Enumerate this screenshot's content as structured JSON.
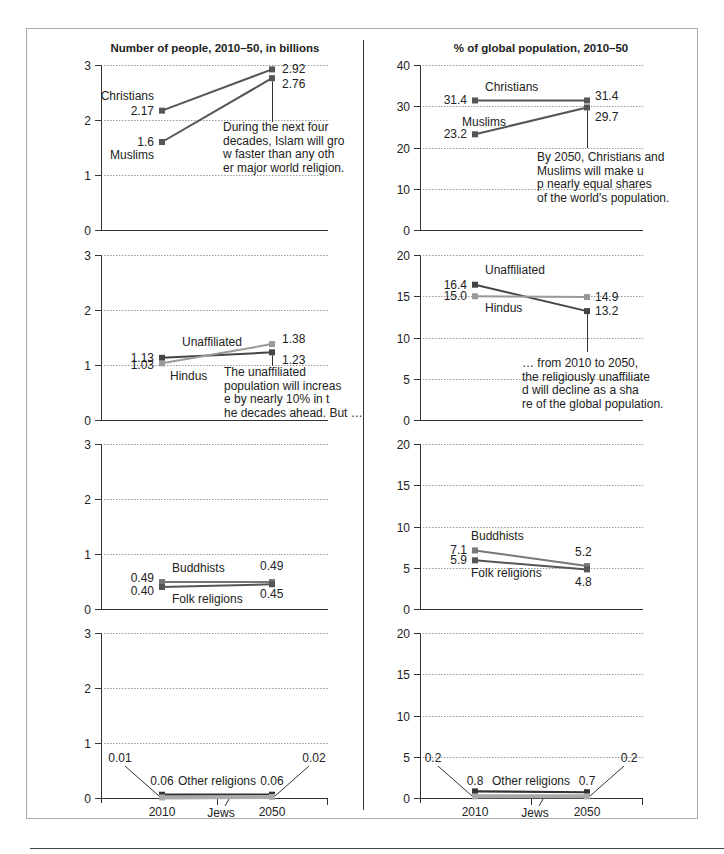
{
  "chart_data": [
    {
      "type": "line",
      "panel": "number-row-1",
      "title": "Number of people, 2010–50, in billions",
      "x": [
        "2010",
        "2050"
      ],
      "ylim": [
        0,
        3
      ],
      "yticks": [
        0,
        1,
        2,
        3
      ],
      "grid": true,
      "series": [
        {
          "name": "Christians",
          "values": [
            2.17,
            2.92
          ],
          "labels": [
            "2.17",
            "2.92"
          ],
          "color": "#555555"
        },
        {
          "name": "Muslims",
          "values": [
            1.6,
            2.76
          ],
          "labels": [
            "1.6",
            "2.76"
          ],
          "color": "#555555"
        }
      ],
      "annotation": "During the next four decades, Islam will grow faster than any other major world religion."
    },
    {
      "type": "line",
      "panel": "share-row-1",
      "title": "% of global population, 2010–50",
      "x": [
        "2010",
        "2050"
      ],
      "ylim": [
        0,
        40
      ],
      "yticks": [
        0,
        10,
        20,
        30,
        40
      ],
      "grid": true,
      "series": [
        {
          "name": "Christians",
          "values": [
            31.4,
            31.4
          ],
          "labels": [
            "31.4",
            "31.4"
          ],
          "color": "#555555"
        },
        {
          "name": "Muslims",
          "values": [
            23.2,
            29.7
          ],
          "labels": [
            "23.2",
            "29.7"
          ],
          "color": "#555555"
        }
      ],
      "annotation": "By 2050, Christians and Muslims will make up nearly equal shares of the world's population."
    },
    {
      "type": "line",
      "panel": "number-row-2",
      "x": [
        "2010",
        "2050"
      ],
      "ylim": [
        0,
        3
      ],
      "yticks": [
        0,
        1,
        2,
        3
      ],
      "grid": true,
      "series": [
        {
          "name": "Unaffiliated",
          "values": [
            1.13,
            1.23
          ],
          "labels": [
            "1.13",
            "1.23"
          ],
          "color": "#444444"
        },
        {
          "name": "Hindus",
          "values": [
            1.03,
            1.38
          ],
          "labels": [
            "1.03",
            "1.38"
          ],
          "color": "#999999"
        }
      ],
      "annotation": "The unaffiliated population will increase by nearly 10% in the decades ahead. But …"
    },
    {
      "type": "line",
      "panel": "share-row-2",
      "x": [
        "2010",
        "2050"
      ],
      "ylim": [
        0,
        20
      ],
      "yticks": [
        0,
        5,
        10,
        15,
        20
      ],
      "grid": true,
      "series": [
        {
          "name": "Unaffiliated",
          "values": [
            16.4,
            13.2
          ],
          "labels": [
            "16.4",
            "13.2"
          ],
          "color": "#444444"
        },
        {
          "name": "Hindus",
          "values": [
            15.0,
            14.9
          ],
          "labels": [
            "15.0",
            "14.9"
          ],
          "color": "#999999"
        }
      ],
      "annotation": "… from 2010 to 2050, the religiously unaffiliated will decline as a share of the global population."
    },
    {
      "type": "line",
      "panel": "number-row-3",
      "x": [
        "2010",
        "2050"
      ],
      "ylim": [
        0,
        3
      ],
      "yticks": [
        0,
        1,
        2,
        3
      ],
      "grid": true,
      "series": [
        {
          "name": "Buddhists",
          "values": [
            0.49,
            0.49
          ],
          "labels": [
            "0.49",
            "0.49"
          ],
          "color": "#777777"
        },
        {
          "name": "Folk religions",
          "values": [
            0.4,
            0.45
          ],
          "labels": [
            "0.40",
            "0.45"
          ],
          "color": "#555555"
        }
      ]
    },
    {
      "type": "line",
      "panel": "share-row-3",
      "x": [
        "2010",
        "2050"
      ],
      "ylim": [
        0,
        20
      ],
      "yticks": [
        0,
        5,
        10,
        15,
        20
      ],
      "grid": true,
      "series": [
        {
          "name": "Buddhists",
          "values": [
            7.1,
            5.2
          ],
          "labels": [
            "7.1",
            "5.2"
          ],
          "color": "#777777"
        },
        {
          "name": "Folk religions",
          "values": [
            5.9,
            4.8
          ],
          "labels": [
            "5.9",
            "4.8"
          ],
          "color": "#555555"
        }
      ]
    },
    {
      "type": "line",
      "panel": "number-row-4",
      "x": [
        "2010",
        "2050"
      ],
      "ylim": [
        0,
        3
      ],
      "yticks": [
        0,
        1,
        2,
        3
      ],
      "grid": true,
      "series": [
        {
          "name": "Other religions",
          "values": [
            0.06,
            0.06
          ],
          "labels": [
            "0.06",
            "0.06"
          ],
          "color": "#333333"
        },
        {
          "name": "Jews",
          "values": [
            0.01,
            0.02
          ],
          "labels": [
            "0.01",
            "0.02"
          ],
          "color": "#aaaaaa"
        }
      ],
      "xlabels": [
        "2010",
        "2050"
      ]
    },
    {
      "type": "line",
      "panel": "share-row-4",
      "x": [
        "2010",
        "2050"
      ],
      "ylim": [
        0,
        20
      ],
      "yticks": [
        0,
        5,
        10,
        15,
        20
      ],
      "grid": true,
      "series": [
        {
          "name": "Other religions",
          "values": [
            0.8,
            0.7
          ],
          "labels": [
            "0.8",
            "0.7"
          ],
          "color": "#333333"
        },
        {
          "name": "Jews",
          "values": [
            0.2,
            0.2
          ],
          "labels": [
            "0.2",
            "0.2"
          ],
          "color": "#aaaaaa"
        }
      ],
      "xlabels": [
        "2010",
        "2050"
      ]
    }
  ]
}
